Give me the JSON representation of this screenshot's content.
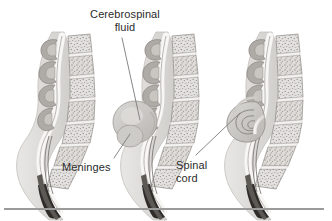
{
  "figure": {
    "background_color": "#ffffff",
    "ink_color": "#2b2b2b",
    "panel_count": 3,
    "labels": [
      {
        "id": "csf",
        "text": "Cerebrospinal\nfluid",
        "name": "label-cerebrospinal-fluid"
      },
      {
        "id": "meninges",
        "text": "Meninges",
        "name": "label-meninges"
      },
      {
        "id": "cord",
        "text": "Spinal\ncord",
        "name": "label-spinal-cord"
      }
    ],
    "panels": [
      {
        "id": "panel-1",
        "condition": "normal spine / spina bifida occulta"
      },
      {
        "id": "panel-2",
        "condition": "meningocele"
      },
      {
        "id": "panel-3",
        "condition": "myelomeningocele"
      }
    ],
    "credit": "COURTESY OF DELMAR CENGAGE LEARNING",
    "leader_lines": 3,
    "rule_color": "#9a9a9a"
  }
}
